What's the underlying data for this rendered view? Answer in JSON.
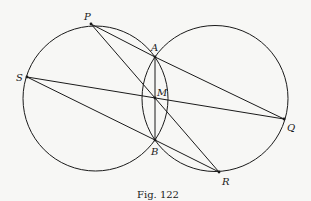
{
  "figure": {
    "caption": "Fig. 122",
    "stroke_color": "#1a1a1a",
    "background_color": "#f7f7f5"
  },
  "circles": [
    {
      "name": "left-circle",
      "cx": 95.5,
      "cy": 98.5,
      "r": 72.5
    },
    {
      "name": "right-circle",
      "cx": 215,
      "cy": 98.5,
      "r": 73
    }
  ],
  "points": {
    "P": {
      "label": "P",
      "x": 91,
      "y": 24
    },
    "A": {
      "label": "A",
      "x": 155,
      "y": 57
    },
    "S": {
      "label": "S",
      "x": 27,
      "y": 77
    },
    "M": {
      "label": "M",
      "x": 155,
      "y": 98
    },
    "Q": {
      "label": "Q",
      "x": 284,
      "y": 119
    },
    "B": {
      "label": "B",
      "x": 155,
      "y": 140
    },
    "R": {
      "label": "R",
      "x": 219,
      "y": 172
    }
  },
  "segments": [
    [
      "P",
      "A"
    ],
    [
      "A",
      "Q"
    ],
    [
      "P",
      "R"
    ],
    [
      "S",
      "Q"
    ],
    [
      "S",
      "B"
    ],
    [
      "B",
      "R"
    ],
    [
      "A",
      "B"
    ]
  ],
  "arcs": [
    {
      "name": "left-inner-arc",
      "description": "arc of right circle between A and B"
    },
    {
      "name": "right-inner-arc",
      "description": "arc of left circle between A and B"
    }
  ]
}
